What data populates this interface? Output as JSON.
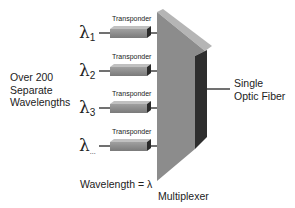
{
  "diagram": {
    "type": "wdm-multiplexer",
    "left_caption": [
      "Over 200",
      "Separate",
      "Wavelengths"
    ],
    "legend": "Wavelength = λ",
    "multiplexer_label": "Multiplexer",
    "output_label": [
      "Single",
      "Optic Fiber"
    ],
    "channels": [
      {
        "symbol": "λ",
        "subscript": "1",
        "device": "Transponder"
      },
      {
        "symbol": "λ",
        "subscript": "2",
        "device": "Transponder"
      },
      {
        "symbol": "λ",
        "subscript": "3",
        "device": "Transponder"
      },
      {
        "symbol": "λ",
        "subscript": "...",
        "device": "Transponder"
      }
    ],
    "colors": {
      "transponder_front": "#8a8a8a",
      "transponder_top": "#b8b8b8",
      "transponder_end": "#2a2a2a",
      "mux_front": "#8c8c8c",
      "mux_top": "#b5b5b5",
      "mux_side": "#2e2e2e",
      "line": "#111111"
    }
  }
}
